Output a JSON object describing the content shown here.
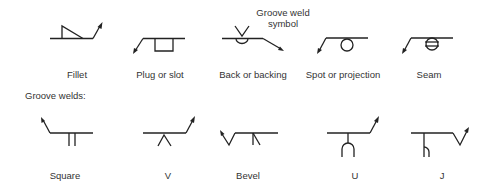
{
  "diagram": {
    "callout": {
      "line1": "Groove weld",
      "line2": "symbol"
    },
    "top_row": [
      {
        "id": "fillet",
        "label": "Fillet"
      },
      {
        "id": "plug-or-slot",
        "label": "Plug or slot"
      },
      {
        "id": "back-or-backing",
        "label": "Back or backing"
      },
      {
        "id": "spot-or-projection",
        "label": "Spot or projection"
      },
      {
        "id": "seam",
        "label": "Seam"
      }
    ],
    "section_heading": "Groove welds:",
    "bottom_row": [
      {
        "id": "square",
        "label": "Square"
      },
      {
        "id": "v",
        "label": "V"
      },
      {
        "id": "bevel",
        "label": "Bevel"
      },
      {
        "id": "u",
        "label": "U"
      },
      {
        "id": "j",
        "label": "J"
      }
    ]
  }
}
